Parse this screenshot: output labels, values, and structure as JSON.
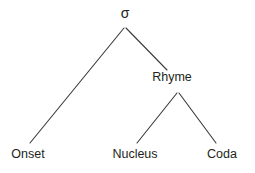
{
  "diagram": {
    "type": "syllable-structure-tree",
    "background_color": "#ffffff",
    "line_color": "#3a3a3c",
    "text_color": "#231f20",
    "line_width": 1.1,
    "nodes": {
      "root": {
        "label": "σ",
        "name": "sigma",
        "x": 125,
        "y": 20
      },
      "onset": {
        "label": "Onset",
        "x": 28,
        "y": 159
      },
      "rhyme": {
        "label": "Rhyme",
        "x": 172,
        "y": 83
      },
      "nucleus": {
        "label": "Nucleus",
        "x": 135,
        "y": 159
      },
      "coda": {
        "label": "Coda",
        "x": 222,
        "y": 159
      }
    },
    "edges": [
      {
        "name": "edge-sigma-onset",
        "from": "root",
        "to": "onset",
        "x1": 124,
        "y1": 28,
        "x2": 30,
        "y2": 143
      },
      {
        "name": "edge-sigma-rhyme",
        "from": "root",
        "to": "rhyme",
        "x1": 126,
        "y1": 28,
        "x2": 167,
        "y2": 70
      },
      {
        "name": "edge-rhyme-nucleus",
        "from": "rhyme",
        "to": "nucleus",
        "x1": 177,
        "y1": 93,
        "x2": 137,
        "y2": 143
      },
      {
        "name": "edge-rhyme-coda",
        "from": "rhyme",
        "to": "coda",
        "x1": 179,
        "y1": 93,
        "x2": 216,
        "y2": 143
      }
    ]
  }
}
